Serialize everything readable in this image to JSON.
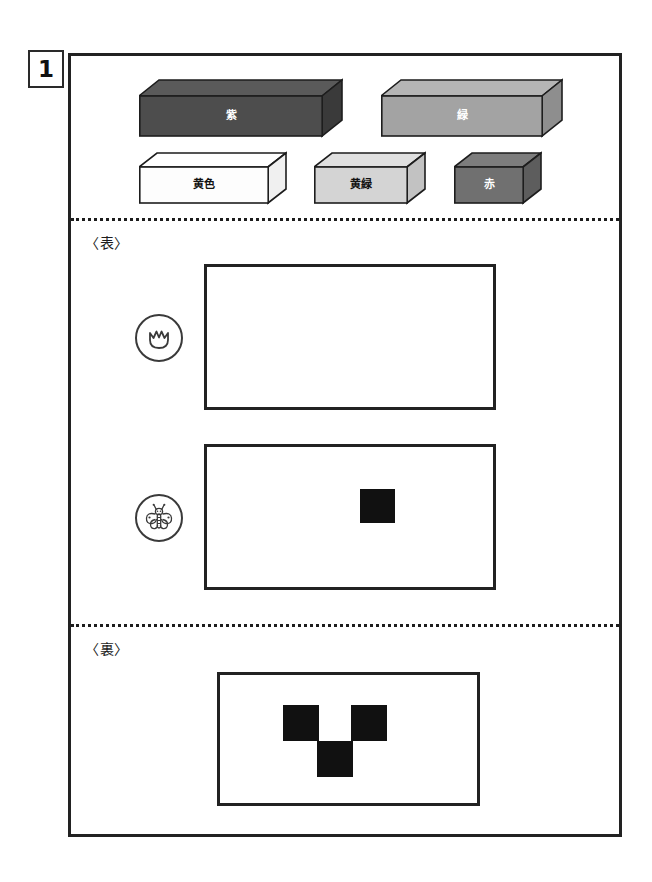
{
  "problem": {
    "number": "1"
  },
  "blocks": {
    "title_hidden": "",
    "items": [
      {
        "id": "block-purple",
        "label": "紫",
        "color_name": "purple",
        "face_color": "#4d4d4d",
        "top_color": "#5a5a5a",
        "side_color": "#3a3a3a",
        "label_color": "#ffffff",
        "size": "long"
      },
      {
        "id": "block-green",
        "label": "緑",
        "color_name": "green",
        "face_color": "#a3a3a3",
        "top_color": "#b5b5b5",
        "side_color": "#8e8e8e",
        "label_color": "#ffffff",
        "size": "long"
      },
      {
        "id": "block-yellow",
        "label": "黄色",
        "color_name": "yellow",
        "face_color": "#fdfdfd",
        "top_color": "#ffffff",
        "side_color": "#f0f0f0",
        "label_color": "#111111",
        "size": "medium"
      },
      {
        "id": "block-yellow-green",
        "label": "黄緑",
        "color_name": "yellow-green",
        "face_color": "#d4d4d4",
        "top_color": "#e0e0e0",
        "side_color": "#c2c2c2",
        "label_color": "#111111",
        "size": "short"
      },
      {
        "id": "block-red",
        "label": "赤",
        "color_name": "red",
        "face_color": "#707070",
        "top_color": "#7d7d7d",
        "side_color": "#5d5d5d",
        "label_color": "#ffffff",
        "size": "tiny"
      }
    ]
  },
  "front_section": {
    "label": "〈表〉",
    "rows": [
      {
        "id": "row-tulip",
        "icon": "tulip-icon",
        "grid": {
          "cols": 8,
          "rows": 4,
          "filled": []
        }
      },
      {
        "id": "row-butterfly",
        "icon": "butterfly-icon",
        "grid": {
          "cols": 8,
          "rows": 4,
          "filled": [
            {
              "col": 4,
              "row": 1
            }
          ]
        }
      }
    ]
  },
  "back_section": {
    "label": "〈裏〉",
    "grid": {
      "cols": 7,
      "rows": 3,
      "filled": [
        {
          "col": 2,
          "row": 0
        },
        {
          "col": 4,
          "row": 0
        },
        {
          "col": 3,
          "row": 1
        }
      ]
    }
  },
  "colors": {
    "ink": "#222222",
    "fill": "#111111",
    "paper": "#ffffff"
  }
}
